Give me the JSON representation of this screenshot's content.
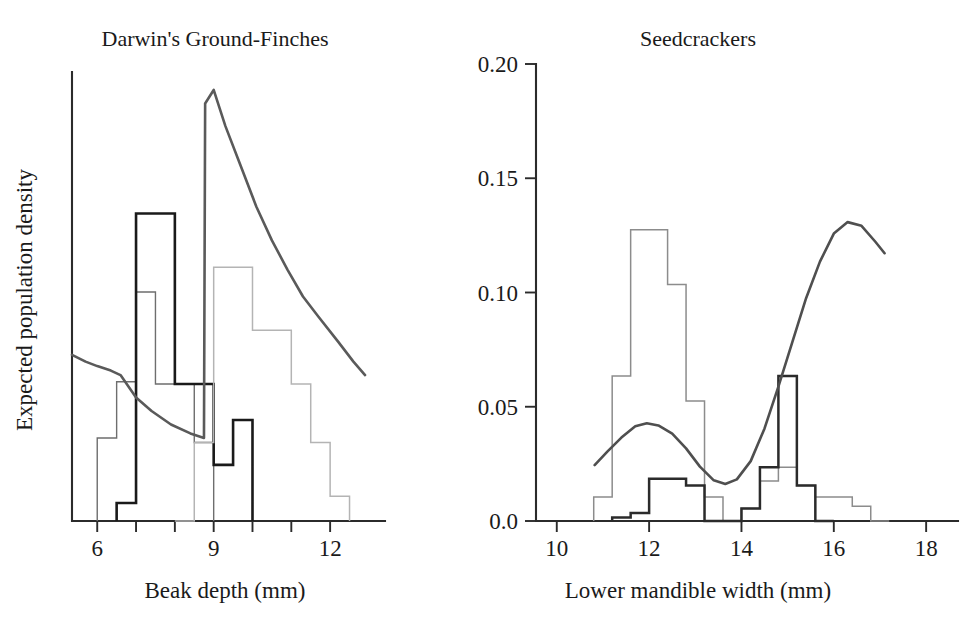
{
  "figure": {
    "background": "#ffffff",
    "ink_color": "#1a1a1a"
  },
  "chart_data": [
    {
      "id": "darwins-ground-finches",
      "type": "histogram",
      "title": "Darwin's Ground-Finches",
      "xlabel": "Beak depth (mm)",
      "ylabel": "Expected population density",
      "xlim": [
        5.35,
        12.95
      ],
      "ylim": [
        0,
        1
      ],
      "xticks": [
        6,
        7,
        8,
        9,
        10,
        11,
        12
      ],
      "xticklabels": [
        "6",
        "",
        "",
        "9",
        "",
        "",
        "12"
      ],
      "yticks": [],
      "yticklabels": [],
      "grid": false,
      "legend": "none",
      "series": [
        {
          "name": "fuliginosa",
          "kind": "histogram",
          "color": "#6e6e6e",
          "linewidth": 1.4,
          "bin_width": 0.5,
          "bin_starts": [
            6.0,
            6.5,
            7.0,
            7.5,
            8.0,
            8.5
          ],
          "values": [
            0.185,
            0.31,
            0.51,
            0.305,
            0.305,
            0.175
          ]
        },
        {
          "name": "fortis",
          "kind": "histogram",
          "color": "#1a1a1a",
          "linewidth": 2.6,
          "bin_width": 0.5,
          "bin_starts": [
            6.5,
            7.0,
            7.5,
            8.0,
            8.5,
            9.0,
            9.5
          ],
          "values": [
            0.04,
            0.685,
            0.685,
            0.305,
            0.305,
            0.125,
            0.225
          ]
        },
        {
          "name": "magnirostris",
          "kind": "histogram",
          "color": "#b4b4b4",
          "linewidth": 1.5,
          "bin_width": 0.5,
          "bin_starts": [
            8.0,
            8.5,
            9.0,
            9.5,
            10.0,
            10.5,
            11.0,
            11.5,
            12.0
          ],
          "values": [
            0.0,
            0.175,
            0.565,
            0.565,
            0.425,
            0.425,
            0.305,
            0.175,
            0.055
          ]
        },
        {
          "name": "expected-population-density-curve",
          "kind": "curve",
          "color": "#5a5a5a",
          "linewidth": 2.6,
          "points": [
            [
              5.35,
              0.37
            ],
            [
              5.7,
              0.355
            ],
            [
              6.0,
              0.345
            ],
            [
              6.35,
              0.335
            ],
            [
              6.6,
              0.325
            ],
            [
              6.8,
              0.3
            ],
            [
              7.0,
              0.275
            ],
            [
              7.4,
              0.245
            ],
            [
              7.9,
              0.215
            ],
            [
              8.4,
              0.195
            ],
            [
              8.75,
              0.185
            ],
            [
              8.78,
              0.93
            ],
            [
              9.0,
              0.96
            ],
            [
              9.3,
              0.88
            ],
            [
              9.7,
              0.79
            ],
            [
              10.1,
              0.7
            ],
            [
              10.5,
              0.625
            ],
            [
              10.9,
              0.56
            ],
            [
              11.3,
              0.5
            ],
            [
              11.7,
              0.455
            ],
            [
              12.2,
              0.4
            ],
            [
              12.6,
              0.355
            ],
            [
              12.9,
              0.325
            ]
          ]
        }
      ]
    },
    {
      "id": "seedcrackers",
      "type": "histogram",
      "title": "Seedcrackers",
      "xlabel": "Lower mandible width (mm)",
      "ylabel": "Mean survival probability",
      "xlim": [
        9.55,
        18.3
      ],
      "ylim": [
        0.0,
        0.2
      ],
      "xticks": [
        10,
        12,
        14,
        16,
        18
      ],
      "xticklabels": [
        "10",
        "12",
        "14",
        "16",
        "18"
      ],
      "yticks": [
        0.0,
        0.05,
        0.1,
        0.15,
        0.2
      ],
      "yticklabels": [
        "0.0",
        "0.05",
        "0.10",
        "0.15",
        "0.20"
      ],
      "grid": false,
      "legend": "none",
      "series": [
        {
          "name": "population-distribution-light",
          "kind": "histogram",
          "color": "#8c8c8c",
          "linewidth": 1.5,
          "bin_width": 0.4,
          "bin_starts": [
            10.8,
            11.2,
            11.6,
            12.0,
            12.4,
            12.8,
            13.2,
            13.6,
            14.0,
            14.4,
            14.8,
            15.2,
            15.6,
            16.0,
            16.4,
            16.8
          ],
          "values": [
            0.0105,
            0.0635,
            0.1275,
            0.1275,
            0.1035,
            0.0525,
            0.0105,
            0.0,
            0.0055,
            0.0175,
            0.0235,
            0.0155,
            0.0105,
            0.0105,
            0.0065,
            0.0
          ]
        },
        {
          "name": "population-distribution-dark",
          "kind": "histogram",
          "color": "#2b2b2b",
          "linewidth": 2.5,
          "bin_width": 0.4,
          "bin_starts": [
            11.2,
            11.6,
            12.0,
            12.4,
            12.8,
            13.2,
            13.6,
            14.0,
            14.4,
            14.8,
            15.2,
            15.6
          ],
          "values": [
            0.0015,
            0.0035,
            0.0185,
            0.0185,
            0.0155,
            0.0,
            0.0,
            0.0055,
            0.0235,
            0.0635,
            0.0155,
            0.0
          ]
        },
        {
          "name": "mean-survival-probability-curve",
          "kind": "curve",
          "color": "#4f4f4f",
          "linewidth": 2.6,
          "points": [
            [
              10.82,
              0.0245
            ],
            [
              11.1,
              0.0305
            ],
            [
              11.4,
              0.0365
            ],
            [
              11.7,
              0.0415
            ],
            [
              11.95,
              0.0428
            ],
            [
              12.2,
              0.0418
            ],
            [
              12.5,
              0.0382
            ],
            [
              12.8,
              0.0318
            ],
            [
              13.1,
              0.0238
            ],
            [
              13.4,
              0.0178
            ],
            [
              13.65,
              0.0162
            ],
            [
              13.9,
              0.0182
            ],
            [
              14.2,
              0.0262
            ],
            [
              14.5,
              0.0405
            ],
            [
              14.8,
              0.0588
            ],
            [
              15.1,
              0.0782
            ],
            [
              15.4,
              0.0975
            ],
            [
              15.7,
              0.1135
            ],
            [
              16.0,
              0.1258
            ],
            [
              16.3,
              0.1308
            ],
            [
              16.6,
              0.1292
            ],
            [
              16.9,
              0.1222
            ],
            [
              17.1,
              0.1172
            ]
          ]
        }
      ]
    }
  ]
}
